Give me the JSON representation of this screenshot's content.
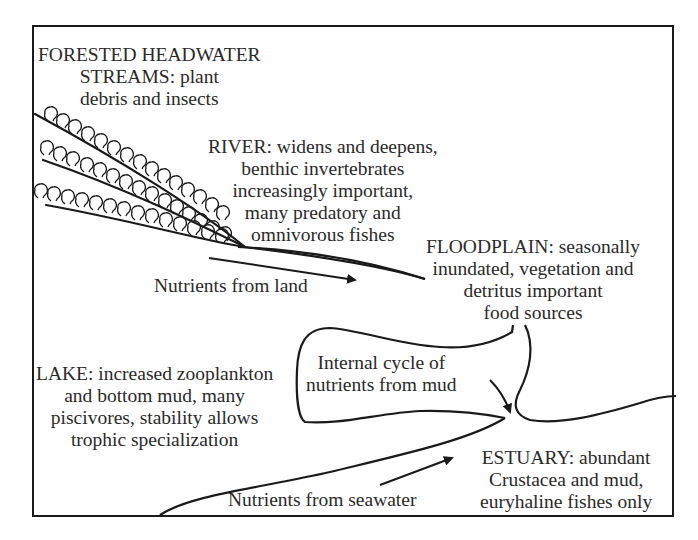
{
  "diagram": {
    "type": "aquatic ecosystem food sources and nutrient flow",
    "colors": {
      "ink": "#1a1a1a",
      "text": "#2a2a2a",
      "background": "#ffffff"
    },
    "labels": {
      "forested_headwater": {
        "lines": [
          "FORESTED HEADWATER",
          "STREAMS: plant",
          "debris and insects"
        ]
      },
      "river": {
        "lines": [
          "RIVER: widens and deepens,",
          "benthic invertebrates",
          "increasingly important,",
          "many predatory and",
          "omnivorous fishes"
        ]
      },
      "floodplain": {
        "lines": [
          "FLOODPLAIN: seasonally",
          "inundated, vegetation and",
          "detritus important",
          "food sources"
        ]
      },
      "lake": {
        "lines": [
          "LAKE: increased zooplankton",
          "and bottom mud, many",
          "piscivores, stability allows",
          "trophic specialization"
        ]
      },
      "internal_cycle": {
        "lines": [
          "Internal cycle of",
          "nutrients from mud"
        ]
      },
      "estuary": {
        "lines": [
          "ESTUARY: abundant",
          "Crustacea and mud,",
          "euryhaline fishes only"
        ]
      },
      "nutrients_land": {
        "text": "Nutrients from land"
      },
      "nutrients_seawater": {
        "text": "Nutrients from seawater"
      }
    },
    "icons": {
      "trees": "tree-icon (rounded canopy outlines along stream banks)",
      "arrows": [
        "nutrients-from-land-arrow",
        "internal-cycle-arrow",
        "nutrients-from-seawater-arrow"
      ]
    }
  }
}
